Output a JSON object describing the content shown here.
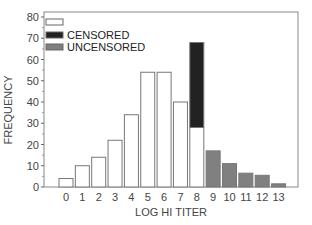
{
  "chart_data": {
    "type": "bar",
    "stacked": true,
    "title": "",
    "xlabel": "LOG HI TITER",
    "ylabel": "FREQUENCY",
    "ylim": [
      0,
      80
    ],
    "yticks": [
      0,
      10,
      20,
      30,
      40,
      50,
      60,
      70,
      80
    ],
    "grid": false,
    "legend_position": "upper-left",
    "categories": [
      "0",
      "1",
      "2",
      "3",
      "4",
      "5",
      "6",
      "7",
      "8",
      "9",
      "10",
      "11",
      "12",
      "13"
    ],
    "series": [
      {
        "name": "",
        "color": "#ffffff",
        "values": [
          4,
          10,
          14,
          22,
          34,
          54,
          54,
          40,
          28,
          0,
          0,
          0,
          0,
          0
        ]
      },
      {
        "name": "CENSORED",
        "color": "#222222",
        "values": [
          0,
          0,
          0,
          0,
          0,
          0,
          0,
          0,
          40,
          0,
          0,
          0,
          0,
          0
        ]
      },
      {
        "name": "UNCENSORED",
        "color": "#808080",
        "values": [
          0,
          0,
          0,
          0,
          0,
          0,
          0,
          0,
          0,
          17,
          11,
          6.5,
          5.5,
          1.5
        ]
      }
    ]
  },
  "legend": [
    {
      "label": "",
      "color": "#ffffff"
    },
    {
      "label": "CENSORED",
      "color": "#222222"
    },
    {
      "label": "UNCENSORED",
      "color": "#808080"
    }
  ],
  "axes": {
    "x_title": "LOG HI TITER",
    "y_title": "FREQUENCY"
  }
}
